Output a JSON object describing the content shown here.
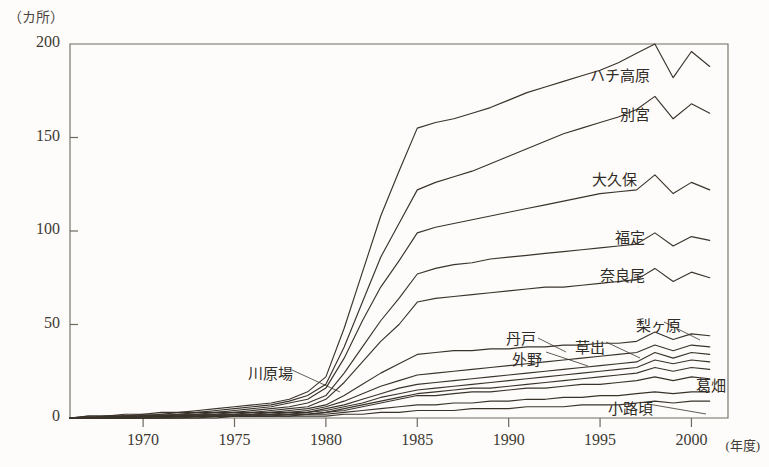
{
  "chart_data": {
    "type": "line",
    "title": "",
    "subtitle": "",
    "xlabel": "年度",
    "ylabel": "カ所",
    "unit_label": "（カ所）",
    "xaxis_unit": "(年度)",
    "grid": false,
    "legend": "inline-labels",
    "xlim": [
      1966,
      2002
    ],
    "ylim": [
      0,
      200
    ],
    "yticks": [
      0,
      50,
      100,
      150,
      200
    ],
    "ytick_labels": [
      "0",
      "50",
      "100",
      "150",
      "200"
    ],
    "xticks": [
      1970,
      1975,
      1980,
      1985,
      1990,
      1995,
      2000
    ],
    "xtick_labels": [
      "1970",
      "1975",
      "1980",
      "1985",
      "1990",
      "1995",
      "2000"
    ],
    "x": [
      1966,
      1967,
      1968,
      1969,
      1970,
      1971,
      1972,
      1973,
      1974,
      1975,
      1976,
      1977,
      1978,
      1979,
      1980,
      1981,
      1982,
      1983,
      1984,
      1985,
      1986,
      1987,
      1988,
      1989,
      1990,
      1991,
      1992,
      1993,
      1994,
      1995,
      1996,
      1997,
      1998,
      1999,
      2000,
      2001
    ],
    "series": [
      {
        "name": "ハチ高原",
        "label": "ハチ高原",
        "values": [
          0,
          1,
          1,
          2,
          2,
          3,
          3,
          4,
          5,
          6,
          7,
          8,
          10,
          14,
          22,
          48,
          78,
          108,
          132,
          155,
          158,
          160,
          163,
          166,
          170,
          174,
          177,
          180,
          183,
          186,
          190,
          195,
          200,
          182,
          196,
          188
        ]
      },
      {
        "name": "別宮",
        "label": "別宮",
        "values": [
          0,
          1,
          1,
          1,
          2,
          2,
          3,
          3,
          4,
          5,
          6,
          7,
          9,
          12,
          18,
          38,
          62,
          86,
          104,
          122,
          126,
          129,
          132,
          136,
          140,
          144,
          148,
          152,
          155,
          158,
          161,
          165,
          172,
          160,
          168,
          163
        ]
      },
      {
        "name": "大久保",
        "label": "大久保",
        "values": [
          0,
          0,
          1,
          1,
          1,
          2,
          2,
          3,
          3,
          4,
          5,
          6,
          8,
          10,
          16,
          32,
          52,
          70,
          84,
          99,
          102,
          104,
          106,
          108,
          110,
          112,
          114,
          116,
          118,
          120,
          121,
          122,
          130,
          120,
          126,
          122
        ]
      },
      {
        "name": "福定",
        "label": "福定",
        "values": [
          0,
          0,
          1,
          1,
          1,
          1,
          2,
          2,
          3,
          3,
          4,
          5,
          6,
          8,
          12,
          24,
          38,
          52,
          64,
          77,
          80,
          82,
          83,
          85,
          86,
          87,
          88,
          89,
          90,
          91,
          92,
          93,
          99,
          92,
          97,
          95
        ]
      },
      {
        "name": "奈良尾",
        "label": "奈良尾",
        "values": [
          0,
          0,
          0,
          1,
          1,
          1,
          2,
          2,
          2,
          3,
          3,
          4,
          5,
          6,
          10,
          19,
          30,
          41,
          50,
          62,
          64,
          65,
          66,
          67,
          68,
          69,
          70,
          70,
          71,
          72,
          73,
          74,
          80,
          73,
          78,
          75
        ]
      },
      {
        "name": "梨ヶ原",
        "label": "梨ヶ原",
        "values": [
          0,
          0,
          0,
          1,
          1,
          1,
          1,
          2,
          2,
          2,
          3,
          3,
          4,
          5,
          7,
          12,
          18,
          24,
          29,
          34,
          35,
          36,
          36,
          37,
          37,
          38,
          38,
          39,
          39,
          40,
          40,
          41,
          46,
          42,
          45,
          44
        ]
      },
      {
        "name": "草出",
        "label": "草出",
        "values": [
          0,
          0,
          0,
          0,
          1,
          1,
          1,
          1,
          2,
          2,
          2,
          3,
          3,
          4,
          6,
          9,
          13,
          17,
          20,
          23,
          24,
          25,
          26,
          27,
          28,
          29,
          30,
          31,
          32,
          33,
          34,
          35,
          39,
          36,
          39,
          38
        ]
      },
      {
        "name": "丹戸",
        "label": "丹戸",
        "values": [
          0,
          0,
          0,
          0,
          1,
          1,
          1,
          1,
          1,
          2,
          2,
          2,
          3,
          3,
          5,
          7,
          10,
          13,
          16,
          18,
          19,
          20,
          21,
          22,
          23,
          24,
          25,
          26,
          27,
          28,
          29,
          30,
          35,
          32,
          35,
          34
        ]
      },
      {
        "name": "外野",
        "label": "外野",
        "values": [
          0,
          0,
          0,
          0,
          0,
          1,
          1,
          1,
          1,
          1,
          2,
          2,
          2,
          3,
          4,
          6,
          8,
          11,
          13,
          15,
          16,
          17,
          18,
          19,
          20,
          21,
          22,
          23,
          24,
          25,
          26,
          27,
          31,
          29,
          31,
          30
        ]
      },
      {
        "name": "葛畑",
        "label": "葛畑",
        "values": [
          0,
          0,
          0,
          0,
          0,
          0,
          1,
          1,
          1,
          1,
          1,
          2,
          2,
          2,
          3,
          5,
          7,
          9,
          11,
          13,
          14,
          15,
          16,
          16,
          17,
          18,
          19,
          20,
          21,
          22,
          23,
          24,
          27,
          25,
          27,
          26
        ]
      },
      {
        "name": "川原場",
        "label": "川原場",
        "values": [
          0,
          0,
          0,
          0,
          0,
          0,
          0,
          1,
          1,
          1,
          1,
          1,
          2,
          2,
          3,
          4,
          6,
          8,
          10,
          12,
          12,
          13,
          14,
          14,
          15,
          16,
          16,
          17,
          18,
          18,
          19,
          20,
          22,
          20,
          22,
          21
        ]
      },
      {
        "name": "小路頃",
        "label": "小路頃",
        "values": [
          0,
          0,
          0,
          0,
          0,
          0,
          0,
          0,
          1,
          1,
          1,
          1,
          1,
          2,
          2,
          3,
          4,
          5,
          6,
          7,
          7,
          8,
          8,
          9,
          9,
          10,
          10,
          11,
          11,
          12,
          12,
          13,
          14,
          13,
          14,
          14
        ]
      },
      {
        "name": "その他",
        "label": "",
        "values": [
          0,
          0,
          0,
          0,
          0,
          0,
          0,
          0,
          0,
          1,
          1,
          1,
          1,
          1,
          1,
          2,
          2,
          3,
          3,
          4,
          4,
          4,
          5,
          5,
          5,
          6,
          6,
          6,
          7,
          7,
          7,
          8,
          9,
          8,
          9,
          9
        ]
      }
    ],
    "annotations": [
      {
        "label": "ハチ高原",
        "x": 590,
        "y": 64
      },
      {
        "label": "別宮",
        "x": 620,
        "y": 103
      },
      {
        "label": "大久保",
        "x": 592,
        "y": 168
      },
      {
        "label": "福定",
        "x": 615,
        "y": 226
      },
      {
        "label": "奈良尾",
        "x": 600,
        "y": 264
      },
      {
        "label": "梨ヶ原",
        "x": 636,
        "y": 314
      },
      {
        "label": "草出",
        "x": 575,
        "y": 336
      },
      {
        "label": "丹戸",
        "x": 506,
        "y": 327
      },
      {
        "label": "外野",
        "x": 512,
        "y": 348
      },
      {
        "label": "葛畑",
        "x": 696,
        "y": 374
      },
      {
        "label": "小路頃",
        "x": 608,
        "y": 397
      },
      {
        "label": "川原場",
        "x": 248,
        "y": 362
      }
    ],
    "colors": {
      "line": "#3a332b",
      "axis": "#6f6a60",
      "background": "#fdfcfa",
      "text": "#2f2b26"
    }
  }
}
